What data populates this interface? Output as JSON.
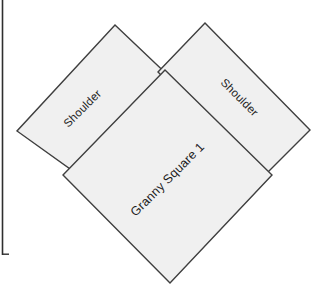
{
  "canvas": {
    "width": 329,
    "height": 300,
    "background_color": "#ffffff",
    "title": "Granny Square Layout"
  },
  "style": {
    "piece_fill": "#f0f0f0",
    "piece_stroke": "#3f3f3f",
    "frame_stroke": "#2e2e2e",
    "label_color": "#1d1d1d"
  },
  "frame": {
    "left_rule_name": "left-margin-rule",
    "bottom_tick_name": "bottom-left-corner-tick"
  },
  "pieces": [
    {
      "id": "shoulder-left",
      "label": "Shoulder",
      "label_rotation": -45,
      "label_x": 83,
      "label_y": 109,
      "points": "115,25 175,82 80,176 17,131",
      "fill": "#f0f0f0"
    },
    {
      "id": "shoulder-right",
      "label": "Shoulder",
      "label_rotation": 45,
      "label_x": 239,
      "label_y": 98,
      "points": "205,23 310,130 263,177 158,72",
      "fill": "#f0f0f0"
    },
    {
      "id": "granny-square-1",
      "label": "Granny Square 1",
      "label_rotation": -45,
      "label_x": 168,
      "label_y": 180,
      "points": "165,70 272,175 170,283 63,175",
      "fill": "#f0f0f0"
    }
  ]
}
